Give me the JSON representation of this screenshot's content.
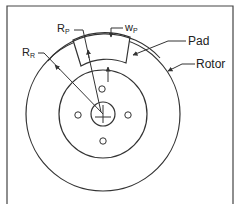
{
  "diagram": {
    "labels": {
      "rr": "R",
      "rr_sub": "R",
      "rp": "R",
      "rp_sub": "P",
      "wp": "w",
      "wp_sub": "P",
      "pad": "Pad",
      "rotor": "Rotor"
    },
    "colors": {
      "stroke": "#333333",
      "background": "#ffffff"
    }
  }
}
